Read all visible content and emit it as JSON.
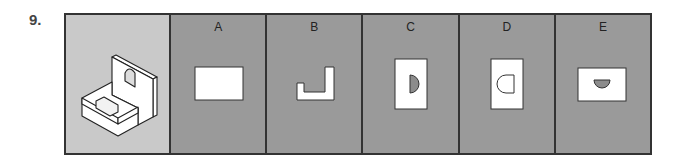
{
  "question": {
    "number": "9.",
    "prompt_image": "isometric-l-bracket-with-arch-hole-and-slot",
    "options": [
      {
        "label": "A",
        "shape": "rectangle"
      },
      {
        "label": "B",
        "shape": "l-notch-profile"
      },
      {
        "label": "C",
        "shape": "tall-rectangle-with-right-half-disc"
      },
      {
        "label": "D",
        "shape": "tall-rectangle-with-left-rounded-outline"
      },
      {
        "label": "E",
        "shape": "wide-rectangle-with-bottom-half-disc"
      }
    ]
  },
  "colors": {
    "prompt_bg": "#c9c9c9",
    "option_bg": "#9a9a9a",
    "border": "#333333",
    "shape_fill": "#ffffff",
    "hole_fill": "#8c8c8c"
  }
}
